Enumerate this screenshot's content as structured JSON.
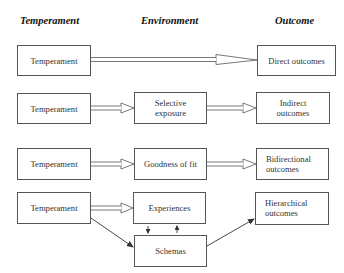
{
  "headers": {
    "temperament": "Temperament",
    "environment": "Environment",
    "outcome": "Outcome"
  },
  "rows": [
    {
      "id": "row-1",
      "temperament": "Temperament",
      "environment": null,
      "outcome": "Direct outcomes"
    },
    {
      "id": "row-2",
      "temperament": "Temperament",
      "environment": "Selective exposure",
      "outcome": "Indirect outcomes"
    },
    {
      "id": "row-3",
      "temperament": "Temperament",
      "environment": "Goodness of fit",
      "outcome": "Bidirectional outcomes"
    },
    {
      "id": "row-4",
      "temperament": "Temperament",
      "environment": "Experiences",
      "environment_secondary": "Schemas",
      "outcome": "Hierarchical outcomes"
    }
  ],
  "edges": [
    {
      "from": "row-1.temperament",
      "to": "row-1.outcome",
      "style": "double-hollow-arrow"
    },
    {
      "from": "row-2.temperament",
      "to": "row-2.environment",
      "style": "double-hollow-arrow"
    },
    {
      "from": "row-2.environment",
      "to": "row-2.outcome",
      "style": "double-hollow-arrow"
    },
    {
      "from": "row-3.temperament",
      "to": "row-3.environment",
      "style": "double-hollow-arrow"
    },
    {
      "from": "row-3.environment",
      "to": "row-3.outcome",
      "style": "double-hollow-arrow"
    },
    {
      "from": "row-4.temperament",
      "to": "row-4.environment",
      "style": "double-hollow-arrow"
    },
    {
      "from": "row-4.temperament",
      "to": "row-4.environment_secondary",
      "style": "single-solid-arrow"
    },
    {
      "from": "row-4.environment",
      "to": "row-4.environment_secondary",
      "style": "small-solid-arrow"
    },
    {
      "from": "row-4.environment_secondary",
      "to": "row-4.environment",
      "style": "small-solid-arrow"
    },
    {
      "from": "row-4.environment_secondary",
      "to": "row-4.outcome",
      "style": "single-solid-arrow"
    }
  ],
  "colors": {
    "line": "#555555",
    "text": "#333333",
    "background": "#ffffff"
  }
}
